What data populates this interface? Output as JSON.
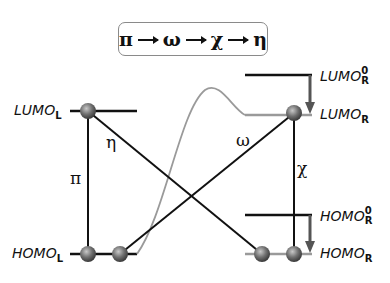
{
  "sequence": {
    "symbols": [
      "π",
      "ω",
      "χ",
      "η"
    ]
  },
  "levels": {
    "lumo_l": {
      "base": "LUMO",
      "sub": "L"
    },
    "homo_l": {
      "base": "HOMO",
      "sub": "L"
    },
    "lumo_r0": {
      "base": "LUMO",
      "sup": "0",
      "sub": "R"
    },
    "lumo_r": {
      "base": "LUMO",
      "sub": "R"
    },
    "homo_r0": {
      "base": "HOMO",
      "sup": "0",
      "sub": "R"
    },
    "homo_r": {
      "base": "HOMO",
      "sub": "R"
    }
  },
  "transitions": {
    "pi": "π",
    "eta": "η",
    "omega": "ω",
    "chi": "χ"
  },
  "colors": {
    "line": "#111111",
    "shifted_level": "#9a9a9a",
    "curve": "#9a9a9a",
    "node": "#6e6e6e",
    "arrow": "#555555"
  }
}
